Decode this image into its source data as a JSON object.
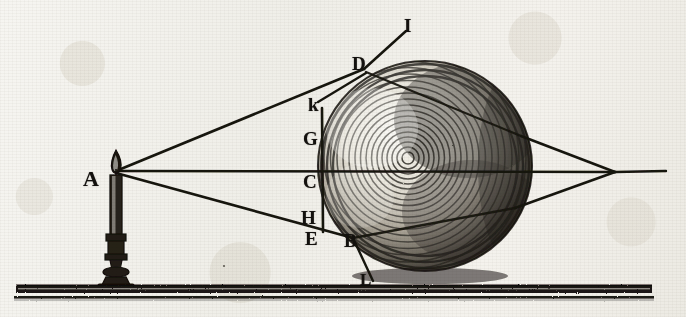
{
  "figure": {
    "medium": "copperplate engraving",
    "ink_color": "#17140f",
    "paper_color": "#f3f2ee",
    "width": 686,
    "height": 317
  },
  "labels": [
    {
      "id": "A",
      "text": "A",
      "x": 83,
      "y": 168,
      "size": 22,
      "role": "light-source-candle-flame"
    },
    {
      "id": "I",
      "text": "I",
      "x": 404,
      "y": 16,
      "size": 19,
      "role": "upper-refracted-ray-endpoint"
    },
    {
      "id": "D",
      "text": "D",
      "x": 352,
      "y": 54,
      "size": 19,
      "role": "upper-sphere-incidence-point"
    },
    {
      "id": "k",
      "text": "k",
      "x": 308,
      "y": 95,
      "size": 19,
      "role": "upper-tangent-point"
    },
    {
      "id": "G",
      "text": "G",
      "x": 303,
      "y": 129,
      "size": 19,
      "role": "chord-upper-end"
    },
    {
      "id": "C",
      "text": "C",
      "x": 303,
      "y": 172,
      "size": 19,
      "role": "sphere-axis-center-near-face"
    },
    {
      "id": "H",
      "text": "H",
      "x": 301,
      "y": 208,
      "size": 19,
      "role": "chord-lower-end"
    },
    {
      "id": "E",
      "text": "E",
      "x": 305,
      "y": 229,
      "size": 19,
      "role": "lower-tangent-point"
    },
    {
      "id": "B",
      "text": "B",
      "x": 344,
      "y": 231,
      "size": 19,
      "role": "lower-sphere-incidence-point"
    },
    {
      "id": "L",
      "text": "L",
      "x": 360,
      "y": 271,
      "size": 17,
      "role": "lower-refracted-ray-endpoint"
    }
  ],
  "geometry": {
    "source_point": {
      "x": 116,
      "y": 171
    },
    "focus_point": {
      "x": 615,
      "y": 172
    },
    "sphere": {
      "cx": 425,
      "cy": 166,
      "rx": 107,
      "ry": 105
    },
    "chord": {
      "x": 322,
      "y1": 108,
      "y2": 232
    },
    "axis": {
      "x1": 116,
      "y1": 171,
      "x2": 666,
      "y2": 172
    },
    "ground": {
      "x1": 16,
      "y1": 288,
      "x2": 652,
      "y2": 291,
      "thickness": 9
    },
    "rays": [
      {
        "name": "upper-ray-A-to-D",
        "from": "A",
        "to": "D",
        "points": [
          [
            116,
            171
          ],
          [
            364,
            69
          ]
        ]
      },
      {
        "name": "upper-ray-D-to-I",
        "from": "D",
        "to": "I",
        "points": [
          [
            364,
            69
          ],
          [
            409,
            29
          ]
        ]
      },
      {
        "name": "chord-ray-D-to-k",
        "from": "D",
        "to": "k",
        "points": [
          [
            364,
            72
          ],
          [
            318,
            101
          ]
        ]
      },
      {
        "name": "axis-ray-A-to-C",
        "from": "A",
        "to": "C",
        "points": [
          [
            116,
            171
          ],
          [
            615,
            172
          ]
        ]
      },
      {
        "name": "lower-ray-A-to-B",
        "from": "A",
        "to": "B",
        "points": [
          [
            116,
            172
          ],
          [
            352,
            238
          ]
        ]
      },
      {
        "name": "lower-ray-B-to-L",
        "from": "B",
        "to": "L",
        "points": [
          [
            352,
            238
          ],
          [
            372,
            281
          ]
        ]
      },
      {
        "name": "internal-ray-D-exit",
        "from": "D",
        "to": "exit-upper",
        "points": [
          [
            364,
            72
          ],
          [
            520,
            135
          ]
        ]
      },
      {
        "name": "internal-ray-B-exit",
        "from": "B",
        "to": "exit-lower",
        "points": [
          [
            352,
            238
          ],
          [
            513,
            207
          ]
        ]
      },
      {
        "name": "exit-ray-upper-to-focus",
        "from": "exit-upper",
        "to": "focus",
        "points": [
          [
            520,
            135
          ],
          [
            615,
            172
          ]
        ]
      },
      {
        "name": "exit-ray-lower-to-focus",
        "from": "exit-lower",
        "to": "focus",
        "points": [
          [
            513,
            207
          ],
          [
            615,
            172
          ]
        ]
      },
      {
        "name": "axis-beyond-focus",
        "from": "focus",
        "to": "right-edge",
        "points": [
          [
            615,
            172
          ],
          [
            666,
            171
          ]
        ]
      }
    ],
    "candle": {
      "base_x": 116,
      "base_y": 287,
      "top_y": 163,
      "flame_height": 18
    }
  },
  "caption": {
    "description": "Candle at A sends rays that refract at the surface of the glass globe and cross at a focus to the right."
  }
}
